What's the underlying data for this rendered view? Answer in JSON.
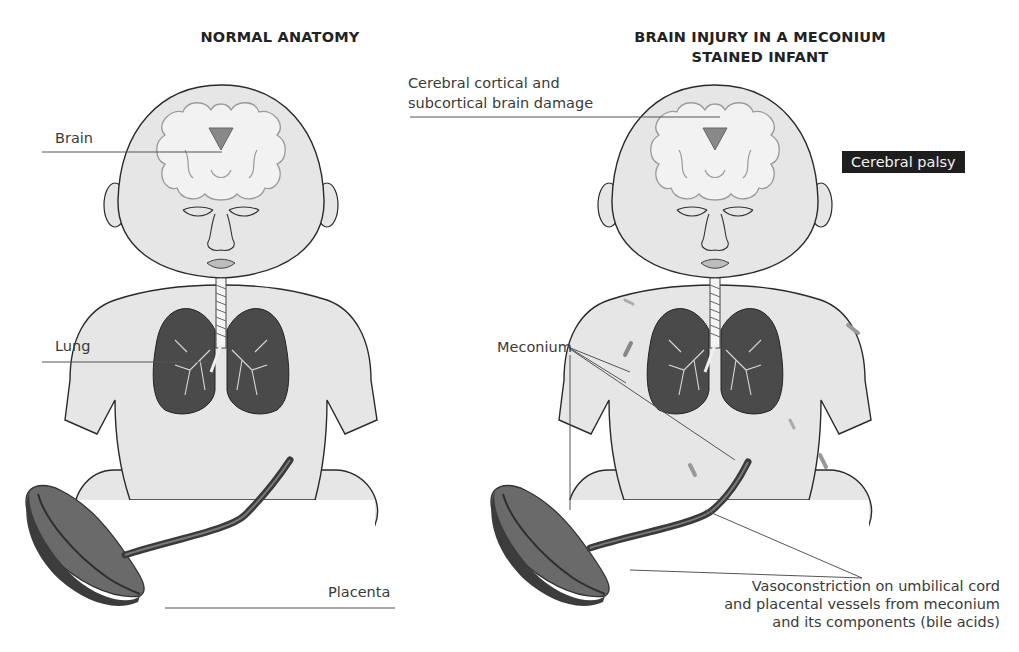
{
  "panels": [
    {
      "id": "normal",
      "heading": "NORMAL ANATOMY",
      "labels": {
        "brain": "Brain",
        "lung": "Lung",
        "placenta": "Placenta"
      }
    },
    {
      "id": "injury",
      "heading_line1": "BRAIN INJURY IN A MECONIUM",
      "heading_line2": "STAINED INFANT",
      "labels": {
        "brain_damage_line1": "Cerebral cortical and",
        "brain_damage_line2": "subcortical brain damage",
        "cerebral_palsy": "Cerebral palsy",
        "meconium": "Meconium",
        "vasoconstriction_line1": "Vasoconstriction on umbilical cord",
        "vasoconstriction_line2": "and placental vessels from meconium",
        "vasoconstriction_line3": "and its components (bile acids)"
      }
    }
  ],
  "colors": {
    "skin": "#e6e6e6",
    "outline": "#2a2a2a",
    "lung": "#4a4a4a",
    "placenta_dark": "#3c3c3c",
    "placenta_mid": "#6a6a6a",
    "badge_bg": "#1e1e1e",
    "leader_line": "#555555"
  }
}
